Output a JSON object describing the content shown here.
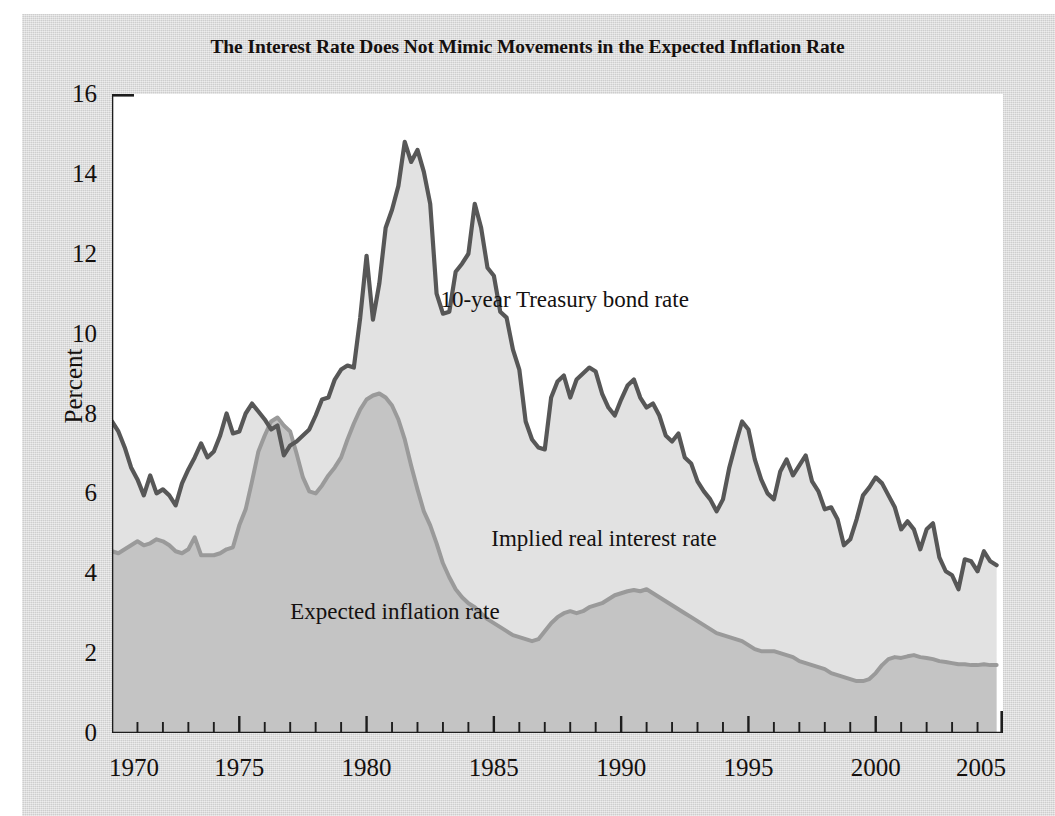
{
  "figure": {
    "title": "The Interest Rate Does Not Mimic Movements in the Expected Inflation Rate",
    "paper_color": "#d9d9d9",
    "plot_background": "#ffffff"
  },
  "chart_data": {
    "type": "area",
    "title": "The Interest Rate Does Not Mimic Movements in the Expected Inflation Rate",
    "xlabel": "",
    "ylabel": "Percent",
    "xlim": [
      1970,
      2005
    ],
    "ylim": [
      0,
      16
    ],
    "ytick_labels": [
      "0",
      "2",
      "4",
      "6",
      "8",
      "10",
      "12",
      "14",
      "16"
    ],
    "ytick_values": [
      0,
      2,
      4,
      6,
      8,
      10,
      12,
      14,
      16
    ],
    "xtick_labels": [
      "1970",
      "1975",
      "1980",
      "1985",
      "1990",
      "1995",
      "2000",
      "2005"
    ],
    "xtick_values": [
      1970,
      1975,
      1980,
      1985,
      1990,
      1995,
      2000,
      2005
    ],
    "minor_xtick_interval": 1,
    "grid": false,
    "legend": "inline-annotations",
    "stacked": true,
    "annotations": [
      {
        "text": "10-year Treasury bond rate",
        "x": 1982.9,
        "y": 10.85
      },
      {
        "text": "Implied real interest rate",
        "x": 1984.9,
        "y": 4.85
      },
      {
        "text": "Expected inflation rate",
        "x": 1977.0,
        "y": 3.02
      }
    ],
    "series": [
      {
        "name": "10-year Treasury bond rate",
        "line_color": "#575757",
        "fill_color": "#e2e2e2",
        "x": [
          1970.0,
          1970.25,
          1970.5,
          1970.75,
          1971.0,
          1971.25,
          1971.5,
          1971.75,
          1972.0,
          1972.25,
          1972.5,
          1972.75,
          1973.0,
          1973.25,
          1973.5,
          1973.75,
          1974.0,
          1974.25,
          1974.5,
          1974.75,
          1975.0,
          1975.25,
          1975.5,
          1975.75,
          1976.0,
          1976.25,
          1976.5,
          1976.75,
          1977.0,
          1977.25,
          1977.5,
          1977.75,
          1978.0,
          1978.25,
          1978.5,
          1978.75,
          1979.0,
          1979.25,
          1979.5,
          1979.75,
          1980.0,
          1980.25,
          1980.5,
          1980.75,
          1981.0,
          1981.25,
          1981.5,
          1981.75,
          1982.0,
          1982.25,
          1982.5,
          1982.75,
          1983.0,
          1983.25,
          1983.5,
          1983.75,
          1984.0,
          1984.25,
          1984.5,
          1984.75,
          1985.0,
          1985.25,
          1985.5,
          1985.75,
          1986.0,
          1986.25,
          1986.5,
          1986.75,
          1987.0,
          1987.25,
          1987.5,
          1987.75,
          1988.0,
          1988.25,
          1988.5,
          1988.75,
          1989.0,
          1989.25,
          1989.5,
          1989.75,
          1990.0,
          1990.25,
          1990.5,
          1990.75,
          1991.0,
          1991.25,
          1991.5,
          1991.75,
          1992.0,
          1992.25,
          1992.5,
          1992.75,
          1993.0,
          1993.25,
          1993.5,
          1993.75,
          1994.0,
          1994.25,
          1994.5,
          1994.75,
          1995.0,
          1995.25,
          1995.5,
          1995.75,
          1996.0,
          1996.25,
          1996.5,
          1996.75,
          1997.0,
          1997.25,
          1997.5,
          1997.75,
          1998.0,
          1998.25,
          1998.5,
          1998.75,
          1999.0,
          1999.25,
          1999.5,
          1999.75,
          2000.0,
          2000.25,
          2000.5,
          2000.75,
          2001.0,
          2001.25,
          2001.5,
          2001.75,
          2002.0,
          2002.25,
          2002.5,
          2002.75,
          2003.0,
          2003.25,
          2003.5,
          2003.75,
          2004.0,
          2004.25,
          2004.5,
          2004.75
        ],
        "y": [
          7.8,
          7.55,
          7.15,
          6.65,
          6.35,
          5.95,
          6.45,
          6.0,
          6.1,
          5.95,
          5.7,
          6.25,
          6.6,
          6.9,
          7.25,
          6.9,
          7.05,
          7.45,
          8.0,
          7.5,
          7.55,
          8.0,
          8.25,
          8.05,
          7.85,
          7.6,
          7.7,
          6.95,
          7.2,
          7.3,
          7.45,
          7.6,
          7.95,
          8.35,
          8.4,
          8.85,
          9.1,
          9.2,
          9.15,
          10.4,
          11.95,
          10.35,
          11.25,
          12.65,
          13.1,
          13.7,
          14.8,
          14.3,
          14.6,
          14.05,
          13.25,
          11.0,
          10.5,
          10.55,
          11.55,
          11.75,
          12.0,
          13.25,
          12.65,
          11.65,
          11.45,
          10.55,
          10.4,
          9.6,
          9.1,
          7.8,
          7.35,
          7.15,
          7.1,
          8.4,
          8.8,
          8.95,
          8.4,
          8.85,
          9.0,
          9.15,
          9.05,
          8.5,
          8.15,
          7.95,
          8.35,
          8.7,
          8.85,
          8.4,
          8.15,
          8.25,
          7.95,
          7.45,
          7.3,
          7.5,
          6.9,
          6.75,
          6.3,
          6.05,
          5.85,
          5.55,
          5.85,
          6.65,
          7.25,
          7.8,
          7.6,
          6.85,
          6.35,
          6.0,
          5.85,
          6.55,
          6.85,
          6.45,
          6.7,
          6.95,
          6.3,
          6.05,
          5.6,
          5.65,
          5.35,
          4.7,
          4.85,
          5.35,
          5.95,
          6.15,
          6.4,
          6.25,
          5.95,
          5.65,
          5.1,
          5.3,
          5.1,
          4.6,
          5.1,
          5.25,
          4.4,
          4.05,
          3.95,
          3.6,
          4.35,
          4.3,
          4.05,
          4.55,
          4.3,
          4.2
        ]
      },
      {
        "name": "Expected inflation rate",
        "line_color": "#9a9a9a",
        "fill_color": "#c4c4c4",
        "x": [
          1970.0,
          1970.25,
          1970.5,
          1970.75,
          1971.0,
          1971.25,
          1971.5,
          1971.75,
          1972.0,
          1972.25,
          1972.5,
          1972.75,
          1973.0,
          1973.25,
          1973.5,
          1973.75,
          1974.0,
          1974.25,
          1974.5,
          1974.75,
          1975.0,
          1975.25,
          1975.5,
          1975.75,
          1976.0,
          1976.25,
          1976.5,
          1976.75,
          1977.0,
          1977.25,
          1977.5,
          1977.75,
          1978.0,
          1978.25,
          1978.5,
          1978.75,
          1979.0,
          1979.25,
          1979.5,
          1979.75,
          1980.0,
          1980.25,
          1980.5,
          1980.75,
          1981.0,
          1981.25,
          1981.5,
          1981.75,
          1982.0,
          1982.25,
          1982.5,
          1982.75,
          1983.0,
          1983.25,
          1983.5,
          1983.75,
          1984.0,
          1984.25,
          1984.5,
          1984.75,
          1985.0,
          1985.25,
          1985.5,
          1985.75,
          1986.0,
          1986.25,
          1986.5,
          1986.75,
          1987.0,
          1987.25,
          1987.5,
          1987.75,
          1988.0,
          1988.25,
          1988.5,
          1988.75,
          1989.0,
          1989.25,
          1989.5,
          1989.75,
          1990.0,
          1990.25,
          1990.5,
          1990.75,
          1991.0,
          1991.25,
          1991.5,
          1991.75,
          1992.0,
          1992.25,
          1992.5,
          1992.75,
          1993.0,
          1993.25,
          1993.5,
          1993.75,
          1994.0,
          1994.25,
          1994.5,
          1994.75,
          1995.0,
          1995.25,
          1995.5,
          1995.75,
          1996.0,
          1996.25,
          1996.5,
          1996.75,
          1997.0,
          1997.25,
          1997.5,
          1997.75,
          1998.0,
          1998.25,
          1998.5,
          1998.75,
          1999.0,
          1999.25,
          1999.5,
          1999.75,
          2000.0,
          2000.25,
          2000.5,
          2000.75,
          2001.0,
          2001.25,
          2001.5,
          2001.75,
          2002.0,
          2002.25,
          2002.5,
          2002.75,
          2003.0,
          2003.25,
          2003.5,
          2003.75,
          2004.0,
          2004.25,
          2004.5,
          2004.75
        ],
        "y": [
          4.55,
          4.5,
          4.6,
          4.7,
          4.8,
          4.7,
          4.75,
          4.85,
          4.8,
          4.7,
          4.55,
          4.5,
          4.6,
          4.9,
          4.45,
          4.45,
          4.45,
          4.5,
          4.6,
          4.65,
          5.2,
          5.6,
          6.3,
          7.05,
          7.45,
          7.8,
          7.9,
          7.7,
          7.55,
          7.0,
          6.4,
          6.05,
          6.0,
          6.2,
          6.45,
          6.65,
          6.9,
          7.35,
          7.75,
          8.1,
          8.35,
          8.45,
          8.5,
          8.4,
          8.2,
          7.85,
          7.35,
          6.7,
          6.1,
          5.55,
          5.2,
          4.75,
          4.25,
          3.9,
          3.6,
          3.4,
          3.25,
          3.15,
          3.0,
          2.85,
          2.75,
          2.65,
          2.55,
          2.45,
          2.4,
          2.35,
          2.3,
          2.35,
          2.55,
          2.75,
          2.9,
          3.0,
          3.05,
          3.0,
          3.05,
          3.15,
          3.2,
          3.25,
          3.35,
          3.45,
          3.5,
          3.55,
          3.58,
          3.55,
          3.6,
          3.5,
          3.4,
          3.3,
          3.2,
          3.1,
          3.0,
          2.9,
          2.8,
          2.7,
          2.6,
          2.5,
          2.45,
          2.4,
          2.35,
          2.3,
          2.2,
          2.1,
          2.05,
          2.05,
          2.05,
          2.0,
          1.95,
          1.9,
          1.8,
          1.75,
          1.7,
          1.65,
          1.6,
          1.5,
          1.45,
          1.4,
          1.35,
          1.3,
          1.3,
          1.35,
          1.5,
          1.7,
          1.85,
          1.9,
          1.88,
          1.92,
          1.95,
          1.9,
          1.88,
          1.85,
          1.8,
          1.78,
          1.75,
          1.72,
          1.72,
          1.7,
          1.7,
          1.72,
          1.7,
          1.7
        ]
      }
    ]
  }
}
